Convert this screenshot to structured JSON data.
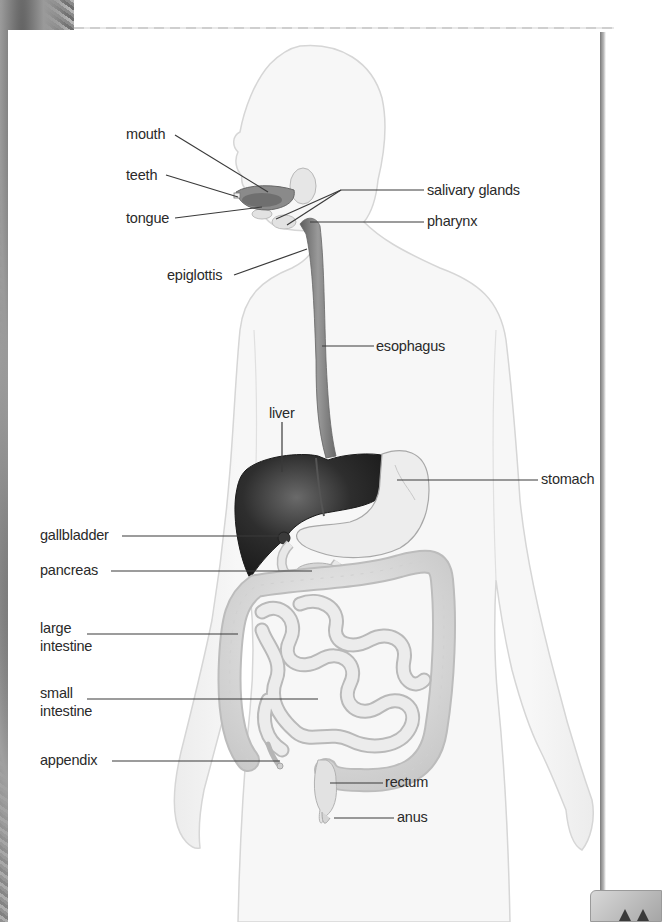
{
  "diagram": {
    "labels": {
      "mouth": "mouth",
      "teeth": "teeth",
      "tongue": "tongue",
      "epiglottis": "epiglottis",
      "salivary_glands": "salivary glands",
      "pharynx": "pharynx",
      "esophagus": "esophagus",
      "liver": "liver",
      "stomach": "stomach",
      "gallbladder": "gallbladder",
      "pancreas": "pancreas",
      "large_intestine_1": "large",
      "large_intestine_2": "intestine",
      "small_intestine_1": "small",
      "small_intestine_2": "intestine",
      "appendix": "appendix",
      "rectum": "rectum",
      "anus": "anus"
    },
    "colors": {
      "label_text": "#2a2a2a",
      "leader_line": "#3a3a3a",
      "body_fill": "#f3f3f3",
      "body_outline": "#cfcfcf",
      "liver": "#2b2b2b",
      "esophagus": "#7d7d7d",
      "intestine": "#dcdcdc"
    }
  }
}
